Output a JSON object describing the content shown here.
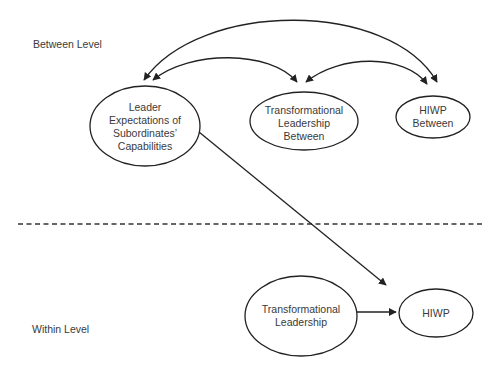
{
  "levels": {
    "between": "Between Level",
    "within": "Within Level"
  },
  "nodes": {
    "leader_expectations": {
      "lines": [
        "Leader",
        "Expectations of",
        "Subordinates’",
        "Capabilities"
      ]
    },
    "tl_between": {
      "lines": [
        "Transformational",
        "Leadership",
        "Between"
      ]
    },
    "hiwp_between": {
      "lines": [
        "HIWP",
        "Between"
      ]
    },
    "tl_within": {
      "lines": [
        "Transformational",
        "Leadership"
      ]
    },
    "hiwp_within": {
      "lines": [
        "HIWP"
      ]
    }
  },
  "edges": [
    {
      "from": "leader_expectations",
      "to": "tl_between",
      "type": "covariance"
    },
    {
      "from": "leader_expectations",
      "to": "hiwp_between",
      "type": "covariance"
    },
    {
      "from": "tl_between",
      "to": "hiwp_between",
      "type": "covariance"
    },
    {
      "from": "leader_expectations",
      "to": "tl_within->hiwp_within",
      "type": "moderation"
    },
    {
      "from": "tl_within",
      "to": "hiwp_within",
      "type": "directed"
    }
  ],
  "colors": {
    "stroke": "#222222",
    "text": "#3a3a3a",
    "background": "#ffffff"
  }
}
